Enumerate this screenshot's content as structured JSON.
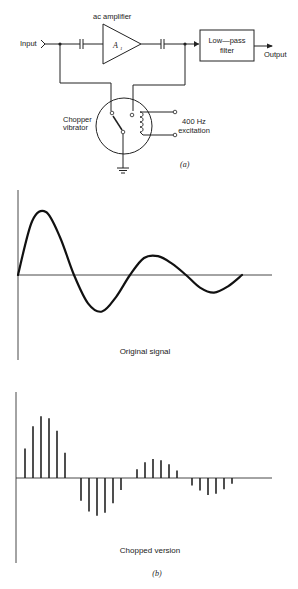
{
  "circuit": {
    "input_label": "Input",
    "amplifier_title": "ac amplifier",
    "amplifier_symbol": "A",
    "amplifier_subscript": "1",
    "filter_line1": "Low—pass",
    "filter_line2": "filter",
    "output_label": "Output",
    "chopper_line1": "Chopper",
    "chopper_line2": "vibrator",
    "excitation_line1": "400 Hz",
    "excitation_line2": "excitation",
    "part_label": "(a)"
  },
  "chart_data": [
    {
      "type": "line",
      "title": "Original signal",
      "description": "Damped oscillation starting at zero",
      "x": [
        0,
        0.5,
        1,
        1.5,
        2,
        2.5,
        3,
        3.5,
        4,
        4.5,
        5,
        5.5,
        6,
        6.5,
        7,
        7.5,
        8
      ],
      "y": [
        0,
        0.85,
        1.0,
        0.6,
        0,
        -0.45,
        -0.58,
        -0.35,
        0,
        0.27,
        0.3,
        0.18,
        0,
        -0.2,
        -0.28,
        -0.18,
        0
      ],
      "xlabel": "",
      "ylabel": "",
      "grid": false
    },
    {
      "type": "bar",
      "title": "Chopped version",
      "description": "Sampled (chopped) pulses of the original signal",
      "values": [
        0.47,
        0.82,
        0.98,
        0.95,
        0.75,
        0.4,
        -0.36,
        -0.53,
        -0.6,
        -0.55,
        -0.4,
        -0.19,
        0.14,
        0.25,
        0.3,
        0.28,
        0.22,
        0.12,
        -0.12,
        -0.2,
        -0.27,
        -0.25,
        -0.18,
        -0.09
      ],
      "xlabel": "",
      "ylabel": "",
      "grid": false
    }
  ],
  "part_b_label": "(b)"
}
